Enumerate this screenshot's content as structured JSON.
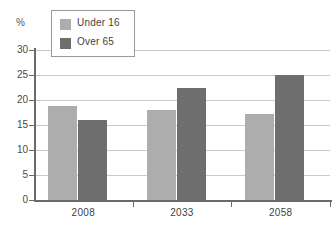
{
  "chart_data": {
    "type": "bar",
    "title": "",
    "subtitle": "",
    "xlabel": "",
    "ylabel": "%",
    "categories": [
      "2008",
      "2033",
      "2058"
    ],
    "series": [
      {
        "name": "Under 16",
        "color": "#adadad",
        "values": [
          18.8,
          18.0,
          17.2
        ]
      },
      {
        "name": "Over 65",
        "color": "#6e6e6e",
        "values": [
          16.0,
          22.5,
          25.0
        ]
      }
    ],
    "ylim": [
      0,
      30
    ],
    "yticks": [
      0,
      5,
      10,
      15,
      20,
      25,
      30
    ],
    "ytick_labels": [
      "0",
      "5",
      "10",
      "15",
      "20",
      "25",
      "30"
    ],
    "grid": true,
    "legend_position": "top-left"
  },
  "legend": {
    "entries": [
      {
        "label": "Under 16"
      },
      {
        "label": "Over 65"
      }
    ]
  },
  "axes": {
    "y_unit": "%"
  }
}
